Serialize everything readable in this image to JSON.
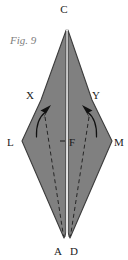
{
  "figure": {
    "caption": "Fig. 9",
    "background_color": "#ffffff",
    "fill_color": "#808080",
    "edge_color": "#3c3c3c",
    "dash_color": "#2b2b2b",
    "arrow_color": "#111111",
    "label_color": "#1a1a1a",
    "caption_color": "#7d7d7d",
    "split_color": "#ffffff",
    "shape_type": "rhombus-kite"
  },
  "vertices": [
    {
      "id": "C",
      "label": "C",
      "x": 67,
      "y": 30,
      "label_x": 64,
      "label_y": 13
    },
    {
      "id": "L",
      "label": "L",
      "x": 22,
      "y": 141,
      "label_x": 6,
      "label_y": 146
    },
    {
      "id": "M",
      "label": "M",
      "x": 112,
      "y": 141,
      "label_x": 114,
      "label_y": 146
    },
    {
      "id": "A",
      "label": "A",
      "x": 64,
      "y": 238,
      "label_x": 56,
      "label_y": 254
    },
    {
      "id": "D",
      "label": "D",
      "x": 70,
      "y": 238,
      "label_x": 70,
      "label_y": 254
    },
    {
      "id": "X",
      "label": "X",
      "x": 41,
      "y": 100,
      "label_x": 27,
      "label_y": 98
    },
    {
      "id": "Y",
      "label": "Y",
      "x": 92,
      "y": 100,
      "label_x": 92,
      "label_y": 98
    },
    {
      "id": "F",
      "label": "F",
      "x": 67,
      "y": 141,
      "label_x": 69,
      "label_y": 146
    }
  ],
  "center_line": {
    "name": "fold-crease-CA",
    "x": 67,
    "y_top": 30,
    "y_bottom": 238
  },
  "dashed_lines": [
    {
      "name": "dashed-left",
      "x1": 45,
      "y1": 117,
      "x2": 64,
      "y2": 236
    },
    {
      "name": "dashed-right",
      "x1": 89,
      "y1": 117,
      "x2": 70,
      "y2": 236
    }
  ],
  "arrows": [
    {
      "name": "fold-arrow-left",
      "direction": "up-right",
      "tip_x": 46,
      "tip_y": 110
    },
    {
      "name": "fold-arrow-right",
      "direction": "up-left",
      "tip_x": 87,
      "tip_y": 110
    }
  ],
  "tick_mark": {
    "name": "center-tick-F",
    "x1": 60,
    "y1": 141,
    "x2": 65,
    "y2": 141
  }
}
